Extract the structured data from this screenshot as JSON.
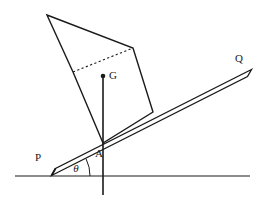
{
  "diagram": {
    "kind": "statics-inclined-rod-with-block",
    "background_color": "#ffffff",
    "stroke_color": "#1a1a1a",
    "labels": {
      "point_p": "P",
      "point_q": "Q",
      "point_a": "A",
      "point_g": "G",
      "angle_theta": "θ"
    },
    "label_positions": {
      "point_p": {
        "x": 38,
        "y": 161
      },
      "point_q": {
        "x": 239,
        "y": 62
      },
      "point_a": {
        "x": 99,
        "y": 157
      },
      "point_g": {
        "x": 109,
        "y": 79
      },
      "angle_theta": {
        "x": 76,
        "y": 172
      }
    },
    "geometry": {
      "ground_line": {
        "x1": 15,
        "y1": 176,
        "x2": 250,
        "y2": 176
      },
      "rod": {
        "name": "rod-PQ",
        "p_end": {
          "x": 52,
          "y": 172
        },
        "q_end": {
          "x": 248,
          "y": 73
        },
        "thickness": 6,
        "cap_at_p": true
      },
      "vertical_line": {
        "x1": 103,
        "y1": 76,
        "x2": 103,
        "y2": 195
      },
      "point_a_on_rod": {
        "x": 103,
        "y": 143
      },
      "center_of_gravity_dot": {
        "x": 103,
        "y": 76,
        "radius": 2.3
      },
      "block_polygon": [
        {
          "x": 47,
          "y": 15
        },
        {
          "x": 133,
          "y": 48
        },
        {
          "x": 153,
          "y": 112
        },
        {
          "x": 103,
          "y": 143
        },
        {
          "x": 73,
          "y": 72
        }
      ],
      "dotted_edge": {
        "x1": 73,
        "y1": 72,
        "x2": 133,
        "y2": 48
      },
      "angle_arc": {
        "center": {
          "x": 52,
          "y": 172
        },
        "radius": 38,
        "from_deg": 0,
        "to_deg": -26.8
      }
    }
  }
}
